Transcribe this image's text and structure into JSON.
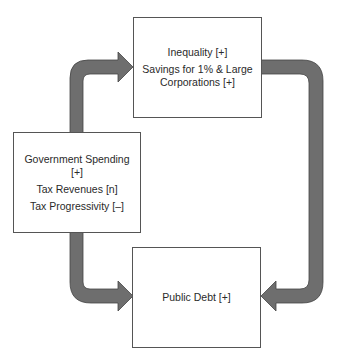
{
  "diagram": {
    "type": "flow",
    "arrow_color": "#6e6e6e",
    "arrow_outline": "#444444",
    "nodes": {
      "top": {
        "lines": [
          "Inequality [+]",
          "Savings for 1% & Large",
          "Corporations [+]"
        ]
      },
      "left": {
        "lines": [
          "Government Spending",
          "[+]",
          "Tax Revenues [n]",
          "Tax Progressivity [–]"
        ]
      },
      "bottom": {
        "lines": [
          "Public Debt [+]"
        ]
      }
    },
    "edges": [
      {
        "from": "left",
        "to": "top"
      },
      {
        "from": "left",
        "to": "bottom"
      },
      {
        "from": "top",
        "to": "bottom"
      }
    ]
  }
}
